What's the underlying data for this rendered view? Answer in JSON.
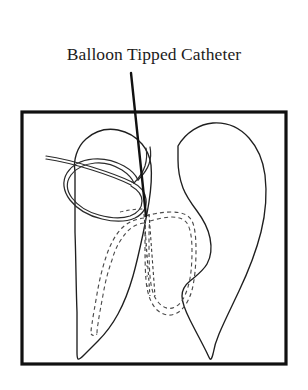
{
  "figure": {
    "title": "Balloon Tipped Catheter",
    "type": "anatomical-line-diagram",
    "background_color": "#ffffff",
    "ink_color": "#1a1a1a",
    "frame": {
      "name": "image-border",
      "x": 22,
      "y": 112,
      "width": 264,
      "height": 252,
      "stroke_color": "#101010",
      "stroke_width": 3.2
    },
    "label": {
      "text": "Balloon Tipped Catheter",
      "x": 154,
      "y": 60,
      "font_size": 17.5,
      "color": "#1c1c1c"
    },
    "leader_line": {
      "name": "label-leader-line",
      "from_x": 131,
      "from_y": 73,
      "to_x": 146,
      "to_y": 216,
      "stroke_color": "#111111",
      "stroke_width": 2.4
    },
    "structures": [
      {
        "name": "left-lung-outline",
        "style": "solid",
        "stroke_width": 1.3
      },
      {
        "name": "right-lung-outline",
        "style": "solid",
        "stroke_width": 1.3
      },
      {
        "name": "catheter-loop",
        "style": "double-line",
        "stroke_width": 1.2
      },
      {
        "name": "cardiac-silhouette",
        "style": "dashed",
        "stroke_width": 1.1
      },
      {
        "name": "catheter-distal-segment",
        "style": "dashed",
        "stroke_width": 1.1
      }
    ]
  }
}
